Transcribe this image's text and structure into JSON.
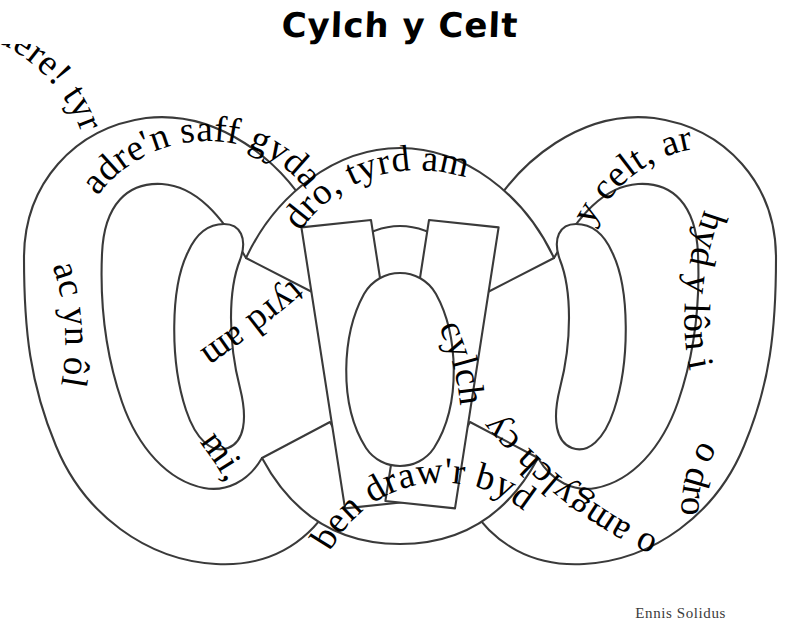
{
  "document": {
    "title": "Cylch y Celt",
    "language": "Welsh",
    "artwork_type": "celtic-knot-word-circle"
  },
  "signature": {
    "text": "Ennis Solidus"
  },
  "knot": {
    "stroke_color": "#3a3a3a",
    "fill_color": "#ffffff",
    "text_color": "#000000",
    "full_phrase": "dro, tyrd am y celt, ar hyd y lôn i o dro o amgylch cylch ben draw'r byd mi, dere! tyrd am ac yn ôl adre'n saff gyda",
    "segments": [
      {
        "id": "top-center",
        "text": "dro,  tyrd am",
        "orientation": "upright",
        "position": "top-centre-arch"
      },
      {
        "id": "top-right",
        "text": "y celt, ar",
        "orientation": "upright",
        "position": "right-loop-upper"
      },
      {
        "id": "right-outer",
        "text": "hyd y lôn i",
        "orientation": "inverted",
        "position": "right-loop-outer"
      },
      {
        "id": "bottom-right",
        "text": "o dro",
        "orientation": "inverted",
        "position": "right-loop-lower"
      },
      {
        "id": "bottom-right-inner",
        "text": "o amgylch cylch",
        "orientation": "inverted",
        "position": "lower-right-diagonal"
      },
      {
        "id": "centre-right",
        "text": "cylch",
        "orientation": "inverted",
        "position": "centre-right-diagonal"
      },
      {
        "id": "bottom-center",
        "text": "ben draw'r byd",
        "orientation": "inverted",
        "position": "bottom-centre-arch"
      },
      {
        "id": "bottom-left-inner",
        "text": "mi,",
        "orientation": "inverted",
        "position": "left-loop-inner-lower"
      },
      {
        "id": "bottom-left",
        "text": "dere! tyrd",
        "orientation": "inverted",
        "position": "left-loop-lower"
      },
      {
        "id": "left-inner",
        "text": "tyrd am",
        "orientation": "inverted",
        "position": "left-inner-diagonal"
      },
      {
        "id": "left-outer",
        "text": "ac yn ôl",
        "orientation": "inverted",
        "position": "left-loop-outer"
      },
      {
        "id": "top-left",
        "text": "adre'n saff gyda",
        "orientation": "upright",
        "position": "left-loop-upper"
      }
    ]
  }
}
